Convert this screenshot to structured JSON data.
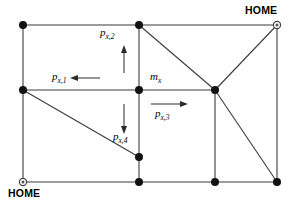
{
  "figure": {
    "background_color": "#ffffff",
    "line_color": "#3b3b3b",
    "node_color": "#111111"
  },
  "labels": {
    "p1": {
      "base": "p",
      "sub": "x,1"
    },
    "p2": {
      "base": "p",
      "sub": "x,2"
    },
    "p3": {
      "base": "p",
      "sub": "x,3"
    },
    "p4": {
      "base": "p",
      "sub": "x,4"
    },
    "m": {
      "base": "m",
      "sub": "x"
    }
  },
  "home_markers": [
    {
      "id": "home-top-right",
      "text": "HOME",
      "x": 277,
      "y": 25
    },
    {
      "id": "home-bottom-left",
      "text": "HOME",
      "x": 23,
      "y": 182
    }
  ],
  "nodes": [
    {
      "id": "n-top-left",
      "x": 23,
      "y": 25,
      "type": "filled"
    },
    {
      "id": "n-top-mid",
      "x": 139,
      "y": 25,
      "type": "filled"
    },
    {
      "id": "n-top-right",
      "x": 277,
      "y": 25,
      "type": "home"
    },
    {
      "id": "n-mid-left",
      "x": 23,
      "y": 90,
      "type": "filled"
    },
    {
      "id": "n-center",
      "x": 139,
      "y": 90,
      "type": "filled"
    },
    {
      "id": "n-mid-right",
      "x": 215,
      "y": 90,
      "type": "filled"
    },
    {
      "id": "n-lower-mid",
      "x": 139,
      "y": 157,
      "type": "filled"
    },
    {
      "id": "n-bot-left",
      "x": 23,
      "y": 182,
      "type": "home"
    },
    {
      "id": "n-bot-mid",
      "x": 139,
      "y": 182,
      "type": "filled"
    },
    {
      "id": "n-bot-right-in",
      "x": 215,
      "y": 182,
      "type": "filled"
    },
    {
      "id": "n-bot-right",
      "x": 277,
      "y": 182,
      "type": "filled"
    }
  ],
  "edges": [
    {
      "id": "e-top",
      "x1": 23,
      "y1": 25,
      "x2": 277,
      "y2": 25
    },
    {
      "id": "e-bottom",
      "x1": 23,
      "y1": 182,
      "x2": 277,
      "y2": 182
    },
    {
      "id": "e-left",
      "x1": 23,
      "y1": 25,
      "x2": 23,
      "y2": 182
    },
    {
      "id": "e-right",
      "x1": 277,
      "y1": 25,
      "x2": 277,
      "y2": 182
    },
    {
      "id": "e-mid-horiz",
      "x1": 23,
      "y1": 90,
      "x2": 215,
      "y2": 90
    },
    {
      "id": "e-mid-vert",
      "x1": 139,
      "y1": 25,
      "x2": 139,
      "y2": 182
    },
    {
      "id": "e-right-vert",
      "x1": 215,
      "y1": 90,
      "x2": 215,
      "y2": 182
    },
    {
      "id": "e-diag-topmid",
      "x1": 139,
      "y1": 25,
      "x2": 215,
      "y2": 90
    },
    {
      "id": "e-diag-home",
      "x1": 215,
      "y1": 90,
      "x2": 277,
      "y2": 25
    },
    {
      "id": "e-diag-botright",
      "x1": 215,
      "y1": 90,
      "x2": 277,
      "y2": 182
    },
    {
      "id": "e-diag-left",
      "x1": 23,
      "y1": 90,
      "x2": 139,
      "y2": 157
    }
  ],
  "arrows": [
    {
      "id": "arrow-p1",
      "direction": "left",
      "x1": 100,
      "y1": 78,
      "x2": 73,
      "y2": 78
    },
    {
      "id": "arrow-p2",
      "direction": "up",
      "x1": 124,
      "y1": 73,
      "x2": 124,
      "y2": 48
    },
    {
      "id": "arrow-p3",
      "direction": "right",
      "x1": 151,
      "y1": 104,
      "x2": 186,
      "y2": 104
    },
    {
      "id": "arrow-p4",
      "direction": "down",
      "x1": 124,
      "y1": 104,
      "x2": 124,
      "y2": 131
    }
  ]
}
